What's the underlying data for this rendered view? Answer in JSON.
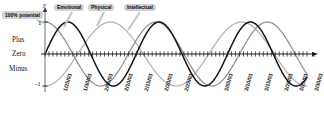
{
  "figure": {
    "kind": "biorhythm-chart",
    "background": "#ffffff"
  },
  "axes": {
    "y_axis_letter": "y",
    "x_axis_letter": "x",
    "y_tick_top": "1",
    "y_tick_bottom": "-1",
    "band_labels": {
      "plus": "Plus",
      "zero": "Zero",
      "minus": "Minus"
    },
    "potential_callout": "100% potential"
  },
  "curve_labels": [
    {
      "label": "Emotional",
      "color": "#8a8a8a"
    },
    {
      "label": "Physical",
      "color": "#141414"
    },
    {
      "label": "Intellectual",
      "color": "#b0b0b0"
    }
  ],
  "chart_data": {
    "type": "line",
    "title": "",
    "subtitle": "",
    "xlabel": "x",
    "ylabel": "y",
    "ylim": [
      -1,
      1
    ],
    "yticks": [
      1,
      0,
      -1
    ],
    "ytick_labels": [
      "1",
      "0",
      "-1"
    ],
    "grid": false,
    "legend_position": "inline-callouts-above-plot",
    "annotations": [
      "100% potential",
      "Plus",
      "Zero",
      "Minus"
    ],
    "x_tick_labels": [
      "1/25/03",
      "1/30/03",
      "2/05/03",
      "2/10/03",
      "2/15/03",
      "2/20/03",
      "2/25/03",
      "3/05/03",
      "3/10/03",
      "3/15/03",
      "3/20/03",
      "3/25/03",
      "3/30/03"
    ],
    "x_tick_positions_px": [
      60,
      80,
      101,
      121,
      141,
      161,
      181,
      221,
      241,
      261,
      281,
      296,
      311
    ],
    "x_minor_tick_spacing_days": 1,
    "series": [
      {
        "name": "Physical",
        "color": "#141414",
        "period_days": 23,
        "amplitude": 1,
        "phase_days": 0,
        "linewidth": 1.5
      },
      {
        "name": "Emotional",
        "color": "#8a8a8a",
        "period_days": 28,
        "amplitude": 1,
        "phase_days": -7,
        "linewidth": 1.2
      },
      {
        "name": "Intellectual",
        "color": "#b0b0b0",
        "period_days": 33,
        "amplitude": 1,
        "phase_days": 8.25,
        "linewidth": 1.2
      }
    ]
  }
}
